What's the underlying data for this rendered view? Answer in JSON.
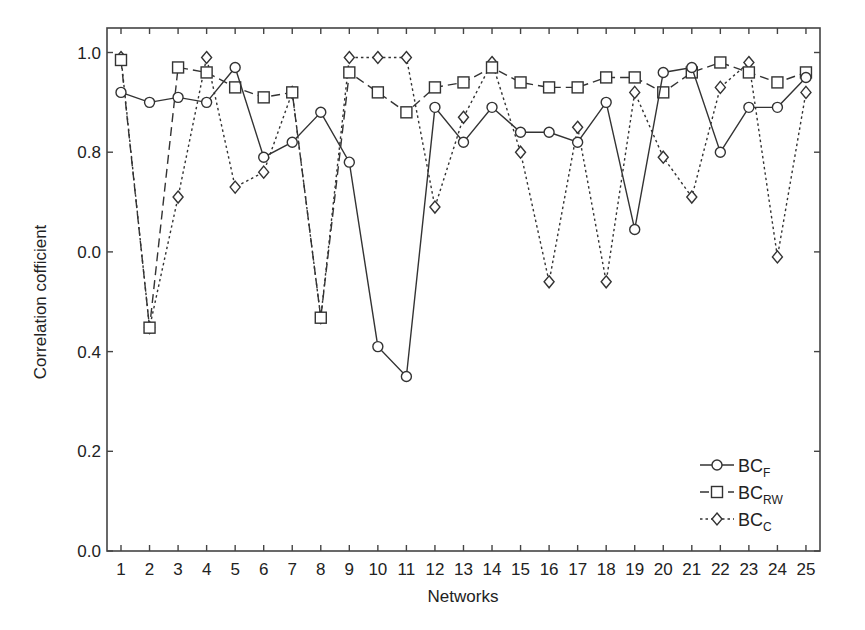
{
  "chart_data": {
    "type": "line",
    "title": "",
    "xlabel": "Networks",
    "ylabel": "Correlation cofficient",
    "x": [
      1,
      2,
      3,
      4,
      5,
      6,
      7,
      8,
      9,
      10,
      11,
      12,
      13,
      14,
      15,
      16,
      17,
      18,
      19,
      20,
      21,
      22,
      23,
      24,
      25
    ],
    "x_tick_labels": [
      "1",
      "2",
      "3",
      "4",
      "5",
      "6",
      "7",
      "8",
      "9",
      "10",
      "11",
      "12",
      "13",
      "14",
      "15",
      "16",
      "17",
      "18",
      "19",
      "20",
      "21",
      "22",
      "23",
      "24",
      "25"
    ],
    "y_ticks": [
      0.0,
      0.2,
      0.4,
      0.6,
      0.8,
      1.0
    ],
    "y_tick_labels": [
      "0.0",
      "0.2",
      "0.4",
      "0.0",
      "0.8",
      "1.0"
    ],
    "ylim": [
      0.0,
      1.0
    ],
    "xlim": [
      0.5,
      25.5
    ],
    "grid": false,
    "legend_position": "lower right",
    "series": [
      {
        "name": "BC_F",
        "label_main": "BC",
        "label_sub": "F",
        "marker": "circle",
        "line_style": "solid",
        "values": [
          0.92,
          0.9,
          0.91,
          0.9,
          0.97,
          0.79,
          0.82,
          0.88,
          0.78,
          0.41,
          0.35,
          0.89,
          0.82,
          0.89,
          0.84,
          0.84,
          0.82,
          0.9,
          0.645,
          0.96,
          0.97,
          0.8,
          0.89,
          0.89,
          0.95
        ]
      },
      {
        "name": "BC_RW",
        "label_main": "BC",
        "label_sub": "RW",
        "marker": "square",
        "line_style": "dashed",
        "values": [
          0.985,
          0.448,
          0.97,
          0.96,
          0.93,
          0.91,
          0.92,
          0.468,
          0.96,
          0.92,
          0.88,
          0.93,
          0.94,
          0.97,
          0.94,
          0.93,
          0.93,
          0.95,
          0.95,
          0.92,
          0.96,
          0.98,
          0.96,
          0.94,
          0.96
        ]
      },
      {
        "name": "BC_C",
        "label_main": "BC",
        "label_sub": "C",
        "marker": "diamond",
        "line_style": "dotted",
        "values": [
          0.99,
          0.448,
          0.71,
          0.99,
          0.73,
          0.76,
          0.92,
          0.468,
          0.99,
          0.99,
          0.99,
          0.69,
          0.87,
          0.98,
          0.8,
          0.54,
          0.85,
          0.54,
          0.92,
          0.79,
          0.71,
          0.93,
          0.98,
          0.59,
          0.92
        ]
      }
    ]
  },
  "colors": {
    "line": "#333333",
    "axis": "#444444",
    "background": "#ffffff"
  }
}
